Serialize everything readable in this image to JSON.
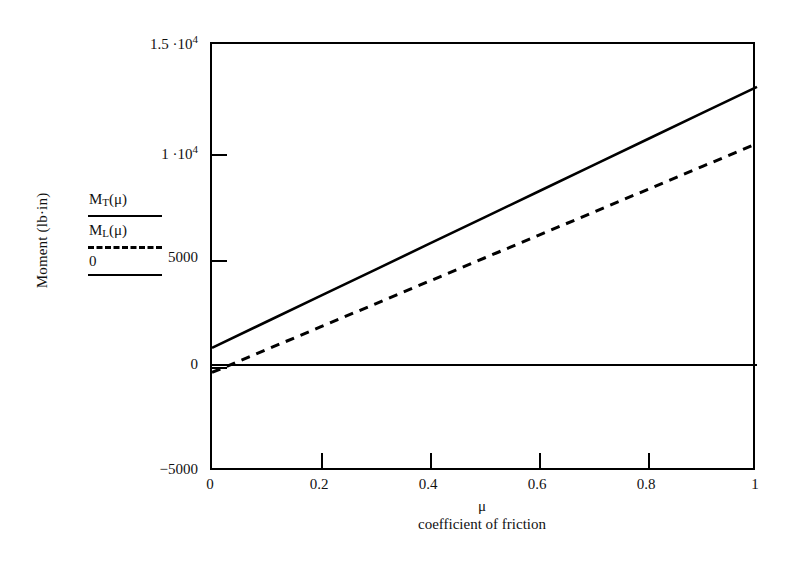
{
  "chart_data": {
    "type": "line",
    "title": "",
    "xlabel": "coefficient of friction",
    "x_symbol": "μ",
    "ylabel": "Moment (lb·in)",
    "xlim": [
      0,
      1
    ],
    "ylim": [
      -5000,
      15000
    ],
    "xticks": [
      "0",
      "0.2",
      "0.4",
      "0.6",
      "0.8",
      "1"
    ],
    "xtick_values": [
      0,
      0.2,
      0.4,
      0.6,
      0.8,
      1
    ],
    "yticks": [
      "1.5 ·10",
      "1 ·10",
      "5000",
      "0",
      "−5000"
    ],
    "ytick_values": [
      15000,
      10000,
      5000,
      0,
      -5000
    ],
    "grid": false,
    "legend_position": "left-outside",
    "series": [
      {
        "name": "M_T(μ)",
        "label_base": "M",
        "label_sub": "T",
        "label_arg": "(μ)",
        "style": "solid",
        "color": "#000000",
        "x": [
          0,
          0.1,
          0.2,
          0.3,
          0.4,
          0.5,
          0.6,
          0.7,
          0.8,
          0.9,
          1
        ],
        "values": [
          800,
          2020,
          3240,
          4460,
          5680,
          6900,
          8120,
          9340,
          10560,
          11780,
          13000
        ]
      },
      {
        "name": "M_L(μ)",
        "label_base": "M",
        "label_sub": "L",
        "label_arg": "(μ)",
        "style": "dashed",
        "color": "#000000",
        "x": [
          0,
          0.1,
          0.2,
          0.3,
          0.4,
          0.5,
          0.6,
          0.7,
          0.8,
          0.9,
          1
        ],
        "values": [
          -350,
          720,
          1790,
          2860,
          3930,
          5000,
          6070,
          7140,
          8210,
          9280,
          10350
        ]
      },
      {
        "name": "0",
        "label_base": "0",
        "label_sub": "",
        "label_arg": "",
        "style": "solid",
        "color": "#000000",
        "x": [
          0,
          1
        ],
        "values": [
          0,
          0
        ]
      }
    ]
  },
  "legend": {
    "entries": [
      {
        "label": "M",
        "sub": "T",
        "arg": "(μ)",
        "sample": "solid"
      },
      {
        "label": "M",
        "sub": "L",
        "arg": "(μ)",
        "sample": "dashed"
      },
      {
        "label": "0",
        "sub": "",
        "arg": "",
        "sample": "solid"
      }
    ]
  },
  "axis": {
    "y_title": "Moment (lb·in)",
    "x_title": "coefficient of friction",
    "x_symbol": "μ",
    "y_tick_labels": [
      {
        "mantissa": "1.5 ·10",
        "exp": "4",
        "value": 15000
      },
      {
        "mantissa": "1 ·10",
        "exp": "4",
        "value": 10000
      },
      {
        "mantissa": "5000",
        "exp": "",
        "value": 5000
      },
      {
        "mantissa": "0",
        "exp": "",
        "value": 0
      },
      {
        "mantissa": "−5000",
        "exp": "",
        "value": -5000
      }
    ],
    "x_tick_labels": [
      "0",
      "0.2",
      "0.4",
      "0.6",
      "0.8",
      "1"
    ]
  }
}
